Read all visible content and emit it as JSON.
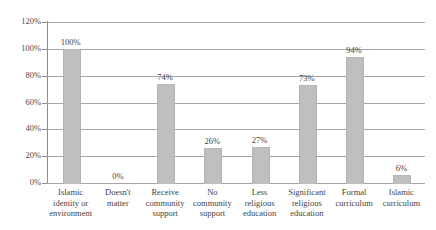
{
  "chart_data": {
    "type": "bar",
    "title": "",
    "xlabel": "",
    "ylabel": "",
    "ylim": [
      0,
      120
    ],
    "ytick_labels": [
      "0%",
      "20%",
      "40%",
      "60%",
      "80%",
      "100%",
      "120%"
    ],
    "ytick_values": [
      0,
      20,
      40,
      60,
      80,
      100,
      120
    ],
    "grid": true,
    "legend": "none",
    "bar_color": "#bfbfbf",
    "gridline_color": "#a6a6a6",
    "axis_color": "#8c8c8c",
    "text_color": "#3f3f3f",
    "categories": [
      "Islamic identity or environment",
      "Doesn't matter",
      "Receive community support",
      "No community support",
      "Less religious education",
      "Significant religious education",
      "Formal curriculum",
      "Islamic curriculum"
    ],
    "category_lines": [
      [
        "Islamic",
        "identity or",
        "environment"
      ],
      [
        "Doesn't",
        "matter"
      ],
      [
        "Receive",
        "community",
        "support"
      ],
      [
        "No",
        "community",
        "support"
      ],
      [
        "Less",
        "religious",
        "education"
      ],
      [
        "Significant",
        "religious",
        "education"
      ],
      [
        "Formal",
        "curriculum"
      ],
      [
        "Islamic",
        "curriculum"
      ]
    ],
    "values": [
      100,
      0,
      74,
      26,
      27,
      73,
      94,
      6
    ],
    "value_labels": [
      "100%",
      "0%",
      "74%",
      "26%",
      "27%",
      "73%",
      "94%",
      "6%"
    ]
  }
}
